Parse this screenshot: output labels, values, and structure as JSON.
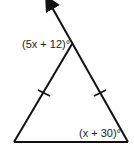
{
  "diagram": {
    "type": "isosceles-triangle",
    "apex_angle_label": "(5x + 12)°",
    "base_right_angle_label": "(x + 30)°",
    "congruent_sides": [
      "left-side",
      "right-side"
    ],
    "exterior_ray": "extends from base-right vertex through apex with arrow",
    "colors": {
      "stroke": "#111111",
      "text": "#222222",
      "background": "#ffffff"
    }
  }
}
